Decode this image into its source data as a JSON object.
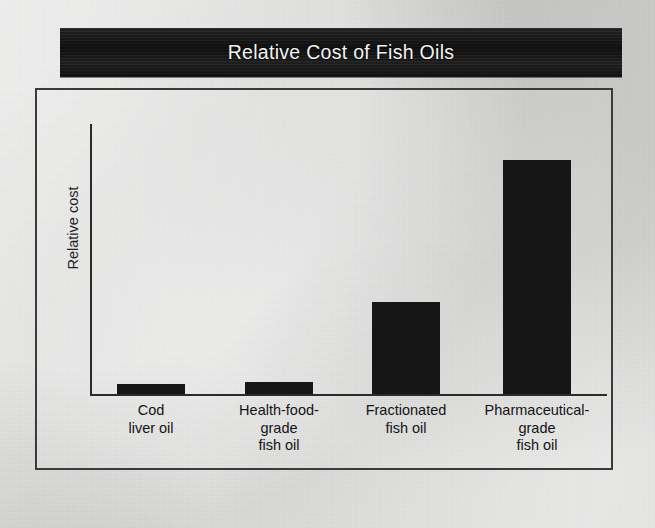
{
  "title": {
    "text": "Relative Cost of Fish Oils",
    "banner_color": "#171717",
    "text_color": "#f2f2f2"
  },
  "chart_data": {
    "type": "bar",
    "title": "Relative Cost of Fish Oils",
    "xlabel": "",
    "ylabel": "Relative cost",
    "categories": [
      "Cod\nliver oil",
      "Health-food-\ngrade\nfish oil",
      "Fractionated\nfish oil",
      "Pharmaceutical-\ngrade\nfish oil"
    ],
    "category_lines": [
      [
        "Cod",
        "liver oil"
      ],
      [
        "Health-food-",
        "grade",
        "fish oil"
      ],
      [
        "Fractionated",
        "fish oil"
      ],
      [
        "Pharmaceutical-",
        "grade",
        "fish oil"
      ]
    ],
    "values": [
      4,
      5,
      39,
      100
    ],
    "value_unit": "relative (largest = 100)",
    "ylim": [
      0,
      116
    ],
    "grid": false,
    "legend": false,
    "bar_color": "#161616",
    "axis_color": "#2b2b2b",
    "bars": [
      {
        "label": "Cod liver oil",
        "value": 4,
        "pixel_height": 10
      },
      {
        "label": "Health-food-grade fish oil",
        "value": 5,
        "pixel_height": 12
      },
      {
        "label": "Fractionated fish oil",
        "value": 39,
        "pixel_height": 92
      },
      {
        "label": "Pharmaceutical-grade fish oil",
        "value": 100,
        "pixel_height": 234
      }
    ]
  },
  "axes": {
    "y_axis_title": "Relative cost",
    "tick_labels": [],
    "baseline_visible": true
  }
}
